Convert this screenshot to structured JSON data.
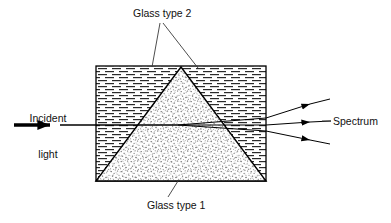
{
  "figure": {
    "type": "optics-ray-diagram",
    "width": 391,
    "height": 223,
    "background_color": "#ffffff",
    "line_color": "#000000"
  },
  "labels": {
    "glass_type_2": "Glass type 2",
    "glass_type_1": "Glass type 1",
    "spectrum": "Spectrum",
    "incident_line_1": "Incident",
    "incident_line_2": "light"
  },
  "elements": {
    "outer_block": {
      "name": "Glass type 2",
      "shape": "rectangle",
      "fill_pattern": "horizontal-dashed-hatch",
      "x": 96,
      "y": 66,
      "width": 170,
      "height": 115
    },
    "inner_prism": {
      "name": "Glass type 1",
      "shape": "triangle",
      "fill_pattern": "stipple-dots",
      "apex": [
        181,
        67
      ],
      "base_left": [
        96,
        181
      ],
      "base_right": [
        266,
        181
      ]
    },
    "incident_ray": {
      "style": "thick-arrow",
      "start": [
        14,
        125
      ],
      "arrowhead": [
        60,
        125
      ],
      "end": [
        178,
        125
      ]
    },
    "refraction_point": [
      178,
      125
    ],
    "emergent_rays": [
      {
        "id": "ray-upper",
        "exit": [
          266,
          118
        ],
        "tip": [
          318,
          104
        ]
      },
      {
        "id": "ray-middle",
        "exit": [
          266,
          125
        ],
        "tip": [
          318,
          122
        ]
      },
      {
        "id": "ray-lower",
        "exit": [
          266,
          131
        ],
        "tip": [
          318,
          140
        ]
      }
    ],
    "leader_lines": [
      {
        "id": "leader-glass2-left",
        "from": [
          160,
          22
        ],
        "to": [
          152,
          67
        ]
      },
      {
        "id": "leader-glass2-right",
        "from": [
          162,
          22
        ],
        "to": [
          198,
          68
        ]
      },
      {
        "id": "leader-glass1",
        "from": [
          178,
          181
        ],
        "to": [
          168,
          197
        ]
      },
      {
        "id": "leader-spectrum",
        "from": [
          331,
          121
        ],
        "to": [
          322,
          121
        ]
      }
    ]
  }
}
